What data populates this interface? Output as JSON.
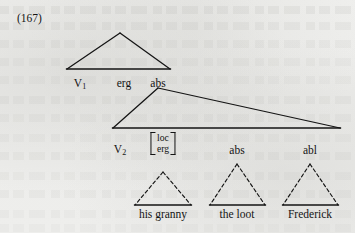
{
  "figure": {
    "number": "(167)",
    "type": "syntax-tree",
    "ink_color": "#141414",
    "page_color": "#eeeeec"
  },
  "nodes": {
    "v1": "V",
    "v1_sub": "1",
    "v2": "V",
    "v2_sub": "2",
    "erg": "erg",
    "abs_top": "abs",
    "abs_mid": "abs",
    "abl": "abl",
    "features": {
      "row1": "loc",
      "row2": "erg"
    }
  },
  "terminals": [
    {
      "label": "his granny"
    },
    {
      "label": "the loot"
    },
    {
      "label": "Frederick"
    }
  ],
  "triangles": {
    "solid": [
      {
        "name": "upper-clause-triangle",
        "apex_x": 120,
        "apex_y": 33,
        "left_x": 67,
        "right_x": 170,
        "base_y": 69
      },
      {
        "name": "lower-clause-triangle",
        "apex_x": 158,
        "apex_y": 88,
        "left_x": 113,
        "right_x": 340,
        "base_y": 128
      }
    ],
    "dashed": [
      {
        "name": "his-granny-triangle",
        "apex_x": 163,
        "apex_y": 172,
        "left_x": 135,
        "right_x": 191,
        "base_y": 205
      },
      {
        "name": "the-loot-triangle",
        "apex_x": 237,
        "apex_y": 164,
        "left_x": 210,
        "right_x": 265,
        "base_y": 205
      },
      {
        "name": "frederick-triangle",
        "apex_x": 310,
        "apex_y": 164,
        "left_x": 283,
        "right_x": 338,
        "base_y": 205
      }
    ]
  }
}
